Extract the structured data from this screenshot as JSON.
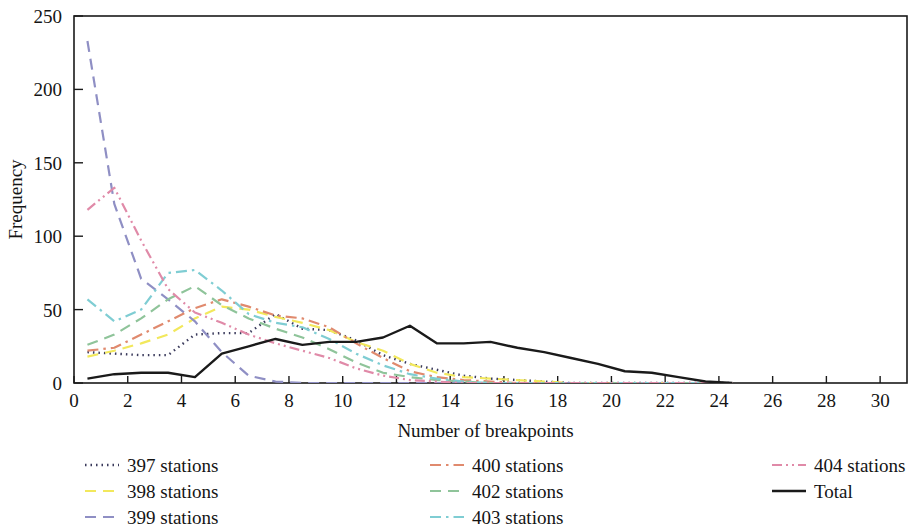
{
  "chart_data": {
    "type": "line",
    "title": "",
    "xlabel": "Number of breakpoints",
    "ylabel": "Frequency",
    "xlim": [
      0,
      31
    ],
    "ylim": [
      0,
      250
    ],
    "xticks": [
      0,
      2,
      4,
      6,
      8,
      10,
      12,
      14,
      16,
      18,
      20,
      22,
      24,
      26,
      28,
      30
    ],
    "yticks": [
      0,
      50,
      100,
      150,
      200,
      250
    ],
    "grid": false,
    "legend_position": "below-plot",
    "x": [
      0.5,
      1.5,
      2.5,
      3.5,
      4.5,
      5.5,
      6.5,
      7.5,
      8.5,
      9.5,
      10.5,
      11.5,
      12.5,
      13.5,
      14.5,
      15.5,
      16.5,
      17.5,
      18.5,
      19.5,
      20.5,
      21.5,
      22.5,
      23.5,
      24.5
    ],
    "series": [
      {
        "name": "397 stations",
        "label": "397 stations",
        "color": "#3b3b5c",
        "dash": "dotted",
        "dasharray": "1.5,4",
        "width": 2.4,
        "values": [
          21,
          20,
          19,
          19,
          33,
          34,
          34,
          47,
          37,
          36,
          29,
          19,
          13,
          9,
          5,
          3,
          2,
          1,
          0,
          0,
          0,
          0,
          0,
          0,
          0
        ]
      },
      {
        "name": "398 stations",
        "label": "398 stations",
        "color": "#f2e85c",
        "dash": "dashed",
        "dasharray": "11,7",
        "width": 2.2,
        "values": [
          18,
          22,
          27,
          33,
          44,
          52,
          50,
          45,
          41,
          36,
          28,
          22,
          13,
          7,
          4,
          3,
          2,
          1,
          0,
          0,
          0,
          0,
          0,
          0,
          0
        ]
      },
      {
        "name": "399 stations",
        "label": "399 stations",
        "color": "#8f8fc4",
        "dash": "dashed",
        "dasharray": "11,7",
        "width": 2.2,
        "values": [
          233,
          122,
          71,
          57,
          42,
          21,
          5,
          1,
          0,
          0,
          0,
          0,
          0,
          0,
          0,
          0,
          0,
          0,
          0,
          0,
          0,
          0,
          0,
          0,
          0
        ]
      },
      {
        "name": "400 stations",
        "label": "400 stations",
        "color": "#e08a6e",
        "dash": "dashdot",
        "dasharray": "11,5,2.5,5",
        "width": 2.2,
        "values": [
          22,
          24,
          33,
          42,
          51,
          57,
          52,
          46,
          44,
          38,
          27,
          17,
          8,
          4,
          2,
          1,
          0,
          0,
          0,
          0,
          0,
          0,
          0,
          0,
          0
        ]
      },
      {
        "name": "402 stations",
        "label": "402 stations",
        "color": "#8fc49a",
        "dash": "dashed",
        "dasharray": "11,7",
        "width": 2.2,
        "values": [
          26,
          33,
          44,
          57,
          66,
          53,
          44,
          37,
          31,
          23,
          14,
          7,
          4,
          2,
          1,
          0,
          0,
          0,
          0,
          0,
          0,
          0,
          0,
          0,
          0
        ]
      },
      {
        "name": "403 stations",
        "label": "403 stations",
        "color": "#7fcdd3",
        "dash": "dashdot",
        "dasharray": "11,5,2.5,5",
        "width": 2.2,
        "values": [
          57,
          42,
          50,
          75,
          77,
          63,
          47,
          41,
          38,
          30,
          20,
          12,
          6,
          3,
          1,
          0,
          0,
          0,
          0,
          0,
          0,
          0,
          0,
          0,
          0
        ]
      },
      {
        "name": "404 stations",
        "label": "404 stations",
        "color": "#e08aa8",
        "dash": "dashdotdot",
        "dasharray": "10,4,2,4,2,4",
        "width": 2.2,
        "values": [
          118,
          133,
          97,
          64,
          48,
          41,
          33,
          27,
          22,
          17,
          10,
          5,
          2,
          1,
          0,
          0,
          0,
          0,
          0,
          0,
          0,
          0,
          0,
          0,
          0
        ]
      },
      {
        "name": "Total",
        "label": "Total",
        "color": "#1a1a1a",
        "dash": "solid",
        "dasharray": "",
        "width": 2.4,
        "values": [
          3,
          6,
          7,
          7,
          4,
          20,
          25,
          30,
          26,
          28,
          28,
          31,
          39,
          27,
          27,
          28,
          24,
          21,
          17,
          13,
          8,
          7,
          4,
          1,
          0
        ]
      }
    ],
    "legend_columns": [
      [
        "397 stations",
        "398 stations",
        "399 stations"
      ],
      [
        "400 stations",
        "402 stations",
        "403 stations"
      ],
      [
        "404 stations",
        "Total"
      ]
    ]
  },
  "axes": {
    "xlabel": "Number of breakpoints",
    "ylabel": "Frequency"
  }
}
